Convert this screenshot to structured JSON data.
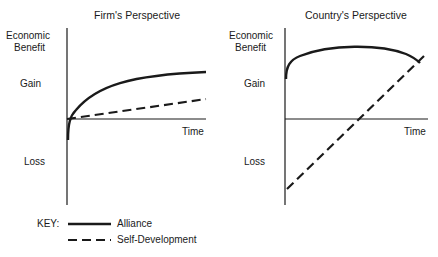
{
  "figure": {
    "panels": [
      {
        "title": "Firm's Perspective",
        "ylabel_line1": "Economic",
        "ylabel_line2": "Benefit",
        "gain_label": "Gain",
        "loss_label": "Loss",
        "xlabel": "Time"
      },
      {
        "title": "Country's Perspective",
        "ylabel_line1": "Economic",
        "ylabel_line2": "Benefit",
        "gain_label": "Gain",
        "loss_label": "Loss",
        "xlabel": "Time"
      }
    ],
    "key": {
      "label": "KEY:",
      "items": [
        {
          "style": "solid",
          "label": "Alliance"
        },
        {
          "style": "dashed",
          "label": "Self-Development"
        }
      ]
    },
    "colors": {
      "line": "#1a1a1a",
      "background": "#ffffff"
    }
  }
}
